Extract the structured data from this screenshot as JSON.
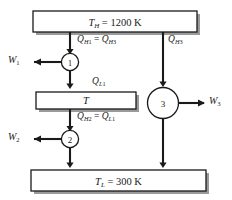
{
  "diagram": {
    "reservoirs": {
      "hot": {
        "temp_symbol": "T",
        "temp_subscript": "H",
        "value": "= 1200 K"
      },
      "intermediate": {
        "temp_symbol": "T"
      },
      "cold": {
        "temp_symbol": "T",
        "temp_subscript": "L",
        "value": "= 300 K"
      }
    },
    "engines": [
      {
        "id": "1",
        "label": "1"
      },
      {
        "id": "2",
        "label": "2"
      },
      {
        "id": "3",
        "label": "3"
      }
    ],
    "heat_flows": [
      {
        "name": "q-h1-eq-qh3",
        "symbol": "Q",
        "sub1": "H",
        "sub1num": "1",
        "eq": "=",
        "symbol2": "Q",
        "sub2": "H",
        "sub2num": "3"
      },
      {
        "name": "q-h3",
        "symbol": "Q",
        "sub1": "H",
        "sub1num": "3"
      },
      {
        "name": "q-l1",
        "symbol": "Q",
        "sub1": "L",
        "sub1num": "1"
      },
      {
        "name": "q-h2-eq-ql1",
        "symbol": "Q",
        "sub1": "H",
        "sub1num": "2",
        "eq": "=",
        "symbol2": "Q",
        "sub2": "L",
        "sub2num": "1"
      }
    ],
    "work_outputs": [
      {
        "name": "w1",
        "symbol": "W",
        "subnum": "1"
      },
      {
        "name": "w2",
        "symbol": "W",
        "subnum": "2"
      },
      {
        "name": "w3",
        "symbol": "W",
        "subnum": "3"
      }
    ],
    "colors": {
      "stroke": "#1a1a1a",
      "shadow": "#9a9a9a",
      "background": "#ffffff"
    }
  }
}
